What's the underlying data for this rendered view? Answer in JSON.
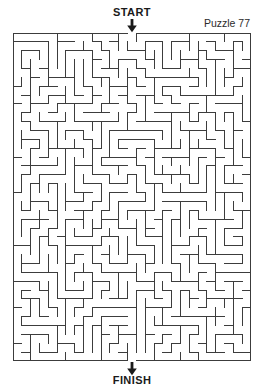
{
  "page": {
    "type": "maze-puzzle",
    "background_color": "#ffffff",
    "width": 264,
    "height": 383
  },
  "labels": {
    "start": "START",
    "finish": "FINISH",
    "puzzle_number": "Puzzle 77"
  },
  "icons": {
    "start_arrow": "down-arrow-icon",
    "finish_arrow": "down-arrow-icon"
  },
  "maze": {
    "columns": 27,
    "rows": 37,
    "cell_size": 8.815,
    "wall_color": "#3c3c3c",
    "wall_thickness": 1,
    "border_thickness": 1.3,
    "origin_x": 13,
    "origin_y": 33,
    "width": 238,
    "height": 328,
    "entrance_column": 13,
    "exit_column": 13,
    "seed": 7701
  }
}
